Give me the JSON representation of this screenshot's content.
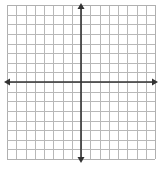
{
  "diagram": {
    "type": "coordinate-plane",
    "grid": {
      "columns": 16,
      "rows": 16,
      "left": 7,
      "top": 5,
      "right": 155,
      "bottom": 159,
      "line_color": "#b8b8b8",
      "border_color": "#b0b0b0"
    },
    "axes": {
      "x_axis_y": 82,
      "y_axis_x": 81,
      "x_axis_start": 4,
      "x_axis_end": 158,
      "y_axis_start": 3,
      "y_axis_end": 163,
      "color": "#333333",
      "arrows": [
        "left",
        "right",
        "up",
        "down"
      ]
    }
  }
}
